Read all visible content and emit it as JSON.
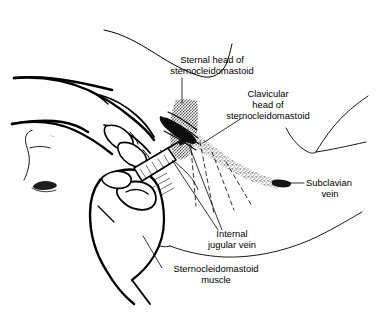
{
  "figure": {
    "background_color": "#ffffff",
    "ink_color": "#000000",
    "width": 387,
    "height": 312
  },
  "labels": [
    {
      "id": "sternal-head",
      "name": "sternal head of sternocleidomastoid",
      "lines": [
        "Sternal head of",
        "sternocleidomastoid"
      ],
      "line1": "Sternal head of",
      "line2": "sternocleidomastoid",
      "x": 212,
      "y": 63,
      "align": "middle",
      "leader": "solid"
    },
    {
      "id": "clavicular-head",
      "name": "clavicular head of sternocleidomastoid",
      "lines": [
        "Clavicular",
        "head of",
        "sternocleidomastoid"
      ],
      "line1": "Clavicular",
      "line2": "head of",
      "line3": "sternocleidomastoid",
      "x": 268,
      "y": 97,
      "align": "middle",
      "leader": "solid"
    },
    {
      "id": "subclavian-vein",
      "name": "subclavian vein",
      "lines": [
        "Subclavian",
        "vein"
      ],
      "line1": "Subclavian",
      "line2": "vein",
      "x": 307,
      "y": 182,
      "align": "left",
      "leader": "dash-tick"
    },
    {
      "id": "internal-jugular-vein",
      "name": "internal jugular vein",
      "lines": [
        "Internal",
        "jugular vein"
      ],
      "line1": "Internal",
      "line2": "jugular vein",
      "x": 232,
      "y": 237,
      "align": "middle",
      "leader": "solid"
    },
    {
      "id": "sternocleidomastoid-muscle",
      "name": "sternocleidomastoid muscle",
      "lines": [
        "Sternocleidomastoid",
        "muscle"
      ],
      "line1": "Sternocleidomastoid",
      "line2": "muscle",
      "x": 216,
      "y": 272,
      "align": "middle",
      "leader": "solid"
    }
  ],
  "anatomy": {
    "patient_neck": "neck and shoulder contour",
    "patient_face": "face in profile at left",
    "shoulder": "shoulder and clavicle contour at right",
    "chest": "chest contour along bottom",
    "muscle_sternal_head": "stippled sternal head of sternocleidomastoid",
    "muscle_clavicular_head": "stippled clavicular head of sternocleidomastoid",
    "subclavian_vein_band": "stippled curved band of subclavian vein"
  },
  "instruments": {
    "syringe": "syringe with needle held in lower hand",
    "upper_hand": "palpating hand with index and middle fingers",
    "lower_hand": "hand gripping syringe"
  }
}
